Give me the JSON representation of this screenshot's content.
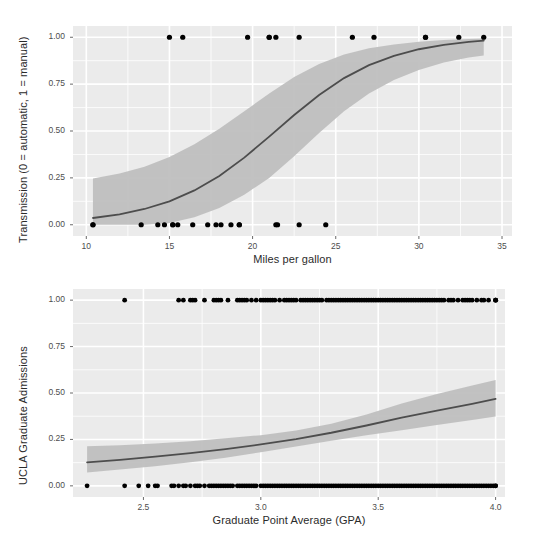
{
  "figure": {
    "width": 541,
    "height": 552,
    "background": "#ffffff",
    "panel_background": "#ebebeb",
    "grid_color": "#ffffff",
    "ribbon_color": "#bfbfbf",
    "line_color": "#4d4d4d",
    "point_color": "#000000",
    "text_color": "#2b2b2b"
  },
  "chart_data": [
    {
      "id": "mtcars-transmission-logistic",
      "type": "scatter",
      "title": "",
      "xlabel": "Miles per gallon",
      "ylabel": "Transmission (0 = automatic, 1 = manual)",
      "xlim": [
        9.2,
        35.6
      ],
      "ylim": [
        -0.06,
        1.06
      ],
      "xticks": [
        10,
        15,
        20,
        25,
        30,
        35
      ],
      "xticklabels": [
        "10",
        "15",
        "20",
        "25",
        "30",
        "35"
      ],
      "yticks": [
        0.0,
        0.25,
        0.5,
        0.75,
        1.0
      ],
      "yticklabels": [
        "0.00",
        "0.25",
        "0.50",
        "0.75",
        "1.00"
      ],
      "grid": true,
      "legend": "none",
      "points": [
        {
          "x": 21.0,
          "y": 1
        },
        {
          "x": 21.0,
          "y": 1
        },
        {
          "x": 22.8,
          "y": 1
        },
        {
          "x": 21.4,
          "y": 0
        },
        {
          "x": 18.7,
          "y": 0
        },
        {
          "x": 18.1,
          "y": 0
        },
        {
          "x": 14.3,
          "y": 0
        },
        {
          "x": 24.4,
          "y": 0
        },
        {
          "x": 22.8,
          "y": 0
        },
        {
          "x": 19.2,
          "y": 0
        },
        {
          "x": 17.8,
          "y": 0
        },
        {
          "x": 16.4,
          "y": 0
        },
        {
          "x": 17.3,
          "y": 0
        },
        {
          "x": 15.2,
          "y": 0
        },
        {
          "x": 10.4,
          "y": 0
        },
        {
          "x": 10.4,
          "y": 0
        },
        {
          "x": 14.7,
          "y": 0
        },
        {
          "x": 32.4,
          "y": 1
        },
        {
          "x": 30.4,
          "y": 1
        },
        {
          "x": 33.9,
          "y": 1
        },
        {
          "x": 21.5,
          "y": 0
        },
        {
          "x": 15.5,
          "y": 0
        },
        {
          "x": 15.2,
          "y": 0
        },
        {
          "x": 13.3,
          "y": 0
        },
        {
          "x": 19.2,
          "y": 0
        },
        {
          "x": 27.3,
          "y": 1
        },
        {
          "x": 26.0,
          "y": 1
        },
        {
          "x": 30.4,
          "y": 1
        },
        {
          "x": 15.8,
          "y": 1
        },
        {
          "x": 19.7,
          "y": 1
        },
        {
          "x": 15.0,
          "y": 1
        },
        {
          "x": 21.4,
          "y": 1
        }
      ],
      "fit_curve": {
        "label": "logistic fit",
        "x": [
          10.4,
          12.0,
          13.5,
          15.0,
          16.5,
          18.0,
          19.5,
          21.0,
          22.5,
          24.0,
          25.5,
          27.0,
          28.5,
          30.0,
          31.5,
          33.0,
          33.9
        ],
        "y": [
          0.036,
          0.055,
          0.084,
          0.125,
          0.183,
          0.26,
          0.358,
          0.47,
          0.585,
          0.692,
          0.782,
          0.851,
          0.901,
          0.936,
          0.959,
          0.975,
          0.982
        ],
        "lower": [
          0.0,
          0.0,
          0.0,
          0.01,
          0.04,
          0.09,
          0.16,
          0.25,
          0.365,
          0.49,
          0.605,
          0.7,
          0.772,
          0.826,
          0.865,
          0.892,
          0.903
        ],
        "upper": [
          0.247,
          0.273,
          0.31,
          0.362,
          0.43,
          0.512,
          0.605,
          0.7,
          0.788,
          0.858,
          0.908,
          0.941,
          0.962,
          0.976,
          0.985,
          0.991,
          0.993
        ]
      }
    },
    {
      "id": "ucla-admissions-logistic",
      "type": "scatter",
      "title": "",
      "xlabel": "Graduate Point Average (GPA)",
      "ylabel": "UCLA Graduate Admissions",
      "xlim": [
        2.2,
        4.04
      ],
      "ylim": [
        -0.06,
        1.06
      ],
      "xticks": [
        2.5,
        3.0,
        3.5,
        4.0
      ],
      "xticklabels": [
        "2.5",
        "3.0",
        "3.5",
        "4.0"
      ],
      "yticks": [
        0.0,
        0.25,
        0.5,
        0.75,
        1.0
      ],
      "yticklabels": [
        "0.00",
        "0.25",
        "0.50",
        "0.75",
        "1.00"
      ],
      "grid": true,
      "legend": "none",
      "points_admitted_x": [
        2.42,
        2.65,
        2.67,
        2.7,
        2.71,
        2.72,
        2.76,
        2.8,
        2.81,
        2.82,
        2.83,
        2.86,
        2.9,
        2.91,
        2.92,
        2.93,
        2.94,
        2.96,
        2.98,
        3.0,
        3.01,
        3.02,
        3.03,
        3.04,
        3.05,
        3.06,
        3.08,
        3.1,
        3.11,
        3.12,
        3.13,
        3.14,
        3.15,
        3.17,
        3.18,
        3.19,
        3.2,
        3.21,
        3.22,
        3.23,
        3.24,
        3.25,
        3.26,
        3.28,
        3.29,
        3.3,
        3.31,
        3.32,
        3.33,
        3.34,
        3.35,
        3.36,
        3.37,
        3.38,
        3.39,
        3.4,
        3.41,
        3.42,
        3.43,
        3.44,
        3.45,
        3.46,
        3.47,
        3.48,
        3.49,
        3.5,
        3.51,
        3.52,
        3.53,
        3.54,
        3.55,
        3.56,
        3.57,
        3.58,
        3.59,
        3.6,
        3.61,
        3.62,
        3.63,
        3.64,
        3.65,
        3.66,
        3.67,
        3.68,
        3.69,
        3.7,
        3.71,
        3.72,
        3.73,
        3.74,
        3.75,
        3.76,
        3.77,
        3.78,
        3.8,
        3.81,
        3.82,
        3.84,
        3.86,
        3.87,
        3.88,
        3.89,
        3.9,
        3.92,
        3.94,
        3.95,
        3.97,
        4.0,
        4.0,
        4.0
      ],
      "points_rejected_x": [
        2.26,
        2.42,
        2.48,
        2.52,
        2.55,
        2.56,
        2.62,
        2.63,
        2.65,
        2.67,
        2.68,
        2.7,
        2.72,
        2.73,
        2.74,
        2.76,
        2.78,
        2.79,
        2.8,
        2.81,
        2.82,
        2.83,
        2.84,
        2.85,
        2.86,
        2.87,
        2.88,
        2.9,
        2.91,
        2.92,
        2.93,
        2.94,
        2.95,
        2.96,
        2.97,
        2.98,
        3.0,
        3.01,
        3.02,
        3.03,
        3.04,
        3.05,
        3.06,
        3.07,
        3.08,
        3.09,
        3.1,
        3.11,
        3.12,
        3.13,
        3.14,
        3.15,
        3.16,
        3.17,
        3.18,
        3.19,
        3.2,
        3.21,
        3.22,
        3.23,
        3.24,
        3.25,
        3.26,
        3.27,
        3.28,
        3.29,
        3.3,
        3.31,
        3.32,
        3.33,
        3.34,
        3.35,
        3.36,
        3.37,
        3.38,
        3.39,
        3.4,
        3.41,
        3.42,
        3.43,
        3.44,
        3.45,
        3.46,
        3.47,
        3.48,
        3.49,
        3.5,
        3.51,
        3.52,
        3.53,
        3.54,
        3.55,
        3.56,
        3.57,
        3.58,
        3.59,
        3.6,
        3.61,
        3.62,
        3.63,
        3.64,
        3.65,
        3.66,
        3.67,
        3.68,
        3.69,
        3.7,
        3.71,
        3.72,
        3.73,
        3.74,
        3.75,
        3.76,
        3.77,
        3.78,
        3.79,
        3.8,
        3.81,
        3.82,
        3.83,
        3.84,
        3.85,
        3.86,
        3.87,
        3.88,
        3.89,
        3.9,
        3.91,
        3.92,
        3.93,
        3.94,
        3.95,
        3.96,
        3.97,
        3.98,
        3.99,
        4.0,
        4.0
      ],
      "fit_curve": {
        "label": "logistic fit",
        "x": [
          2.26,
          2.4,
          2.55,
          2.7,
          2.85,
          3.0,
          3.15,
          3.3,
          3.45,
          3.6,
          3.75,
          3.9,
          4.0
        ],
        "y": [
          0.126,
          0.14,
          0.157,
          0.176,
          0.198,
          0.223,
          0.252,
          0.286,
          0.325,
          0.368,
          0.405,
          0.442,
          0.468
        ],
        "lower": [
          0.072,
          0.088,
          0.106,
          0.127,
          0.152,
          0.181,
          0.212,
          0.243,
          0.272,
          0.3,
          0.328,
          0.355,
          0.374
        ],
        "upper": [
          0.213,
          0.219,
          0.228,
          0.24,
          0.256,
          0.273,
          0.298,
          0.334,
          0.384,
          0.444,
          0.494,
          0.54,
          0.57
        ]
      }
    }
  ]
}
